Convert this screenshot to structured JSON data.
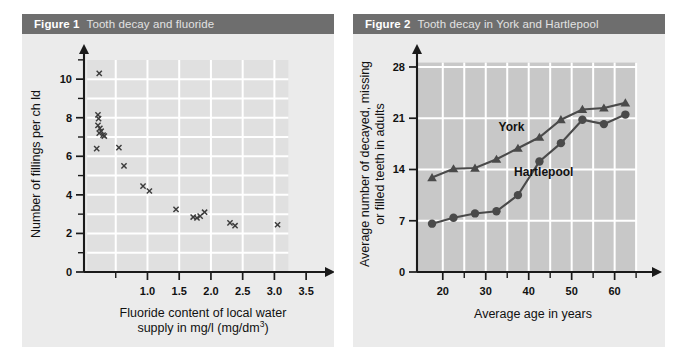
{
  "page": {
    "background_color": "#ffffff",
    "panel_color": "#ebebeb",
    "header_color": "#6e6e6e"
  },
  "figures": [
    {
      "number": "Figure 1",
      "title": "Tooth decay and fluoride",
      "chart_data": {
        "type": "scatter",
        "title": "Tooth decay and fluoride",
        "xlabel": "Fluoride content of local water supply in mg/l (mg/dm³)",
        "xlabel_line1": "Fluoride content of local water",
        "xlabel_line2": "supply in mg/l (mg/dm³)",
        "ylabel": "Number of fillings per ch ld",
        "xlim": [
          0,
          3.75
        ],
        "ylim": [
          0,
          11.2
        ],
        "xticks": [
          0.5,
          1.0,
          1.5,
          2.0,
          2.5,
          3.0,
          3.5
        ],
        "xticklabels": [
          "",
          "1.0",
          "1.5",
          "2.0",
          "2.5",
          "3.0",
          "3.5"
        ],
        "yticks": [
          0,
          1,
          2,
          3,
          4,
          5,
          6,
          7,
          8,
          9,
          10,
          11
        ],
        "yticklabels": [
          "0",
          "",
          "2",
          "",
          "4",
          "",
          "6",
          "",
          "8",
          "",
          "10",
          ""
        ],
        "grid": true,
        "marker": "x",
        "marker_color": "#3c3c3c",
        "plot_bg": "#e0e0e0",
        "points": [
          {
            "x": 0.24,
            "y": 10.3
          },
          {
            "x": 0.22,
            "y": 8.15
          },
          {
            "x": 0.23,
            "y": 7.95
          },
          {
            "x": 0.22,
            "y": 7.6
          },
          {
            "x": 0.25,
            "y": 7.45
          },
          {
            "x": 0.27,
            "y": 7.3
          },
          {
            "x": 0.24,
            "y": 7.2
          },
          {
            "x": 0.3,
            "y": 7.1
          },
          {
            "x": 0.32,
            "y": 7.05
          },
          {
            "x": 0.2,
            "y": 6.4
          },
          {
            "x": 0.55,
            "y": 6.45
          },
          {
            "x": 0.63,
            "y": 5.5
          },
          {
            "x": 0.93,
            "y": 4.45
          },
          {
            "x": 1.03,
            "y": 4.2
          },
          {
            "x": 1.45,
            "y": 3.25
          },
          {
            "x": 1.72,
            "y": 2.85
          },
          {
            "x": 1.78,
            "y": 2.8
          },
          {
            "x": 1.83,
            "y": 2.9
          },
          {
            "x": 1.9,
            "y": 3.1
          },
          {
            "x": 2.3,
            "y": 2.55
          },
          {
            "x": 2.38,
            "y": 2.4
          },
          {
            "x": 3.05,
            "y": 2.45
          }
        ]
      }
    },
    {
      "number": "Figure 2",
      "title": "Tooth decay in York and Hartlepool",
      "chart_data": {
        "type": "line",
        "title": "Tooth decay in York and Hartlepool",
        "xlabel": "Average age in years",
        "ylabel": "Average number of decayed, missing or filled teeth in adults",
        "ylabel_line1": "Average number of decayed, missing",
        "ylabel_line2": "or filled teeth in adults",
        "xlim": [
          14,
          68
        ],
        "ylim": [
          0,
          29.5
        ],
        "xticks": [
          20,
          25,
          30,
          35,
          40,
          45,
          50,
          55,
          60,
          65
        ],
        "xticklabels": [
          "20",
          "",
          "30",
          "",
          "40",
          "",
          "50",
          "",
          "60",
          ""
        ],
        "yticks": [
          0,
          7,
          14,
          21,
          28
        ],
        "yticklabels": [
          "0",
          "7",
          "14",
          "21",
          "28"
        ],
        "grid": true,
        "plot_bg": "#c8c8c8",
        "x": [
          17.5,
          22.5,
          27.5,
          32.5,
          37.5,
          42.5,
          47.5,
          52.5,
          57.5,
          62.5
        ],
        "series": [
          {
            "name": "York",
            "marker": "triangle",
            "color": "#4a4a4a",
            "values": [
              12.9,
              14.1,
              14.2,
              15.4,
              16.9,
              18.4,
              20.8,
              22.2,
              22.4,
              23.1
            ]
          },
          {
            "name": "Hartlepool",
            "marker": "circle",
            "color": "#4a4a4a",
            "values": [
              6.6,
              7.4,
              8.0,
              8.3,
              10.5,
              15.1,
              17.6,
              20.8,
              20.2,
              21.5
            ]
          }
        ],
        "annotations": [
          {
            "text": "York",
            "x": 36,
            "y": 19.2
          },
          {
            "text": "Hartlepool",
            "x": 43.5,
            "y": 13.1
          }
        ]
      }
    }
  ]
}
